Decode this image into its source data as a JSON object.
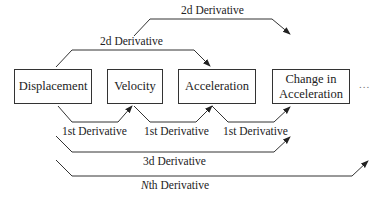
{
  "diagram": {
    "boxes": [
      {
        "id": "displacement",
        "label": "Displacement"
      },
      {
        "id": "velocity",
        "label": "Velocity"
      },
      {
        "id": "acceleration",
        "label": "Acceleration"
      },
      {
        "id": "change-in-acceleration",
        "label_line1": "Change in",
        "label_line2": "Acceleration"
      }
    ],
    "ellipsis": "...",
    "edges": {
      "first_1": {
        "label": "1st Derivative",
        "from": "Displacement",
        "to": "Velocity"
      },
      "first_2": {
        "label": "1st Derivative",
        "from": "Velocity",
        "to": "Acceleration"
      },
      "first_3": {
        "label": "1st Derivative",
        "from": "Acceleration",
        "to": "Change in Acceleration"
      },
      "second_1": {
        "label": "2d Derivative",
        "from": "Displacement",
        "to": "Acceleration"
      },
      "second_2": {
        "label": "2d Derivative",
        "from": "Velocity",
        "to": "Change in Acceleration"
      },
      "third": {
        "label": "3d Derivative",
        "from": "Displacement",
        "to": "Change in Acceleration"
      },
      "nth": {
        "label_italic": "N",
        "label_rest": "th Derivative",
        "from": "Displacement",
        "to": "..."
      }
    },
    "colors": {
      "line": "#333333",
      "text": "#222222",
      "background": "#ffffff"
    }
  }
}
